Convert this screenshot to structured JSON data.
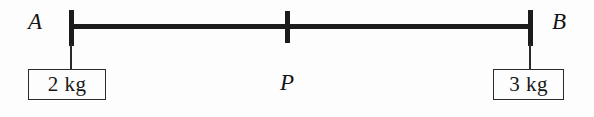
{
  "figure": {
    "background_color": "#fdfdfd",
    "stroke_color": "#1c1c1c"
  },
  "beam": {
    "name": "horizontal-beam"
  },
  "points": [
    {
      "id": "A",
      "label": "A",
      "role": "left-end"
    },
    {
      "id": "P",
      "label": "P",
      "role": "fulcrum-midpoint"
    },
    {
      "id": "B",
      "label": "B",
      "role": "right-end"
    }
  ],
  "masses": [
    {
      "id": "left-mass",
      "label": "2 kg",
      "value": 2,
      "unit": "kg",
      "hangs_from": "A"
    },
    {
      "id": "right-mass",
      "label": "3 kg",
      "value": 3,
      "unit": "kg",
      "hangs_from": "B"
    }
  ]
}
